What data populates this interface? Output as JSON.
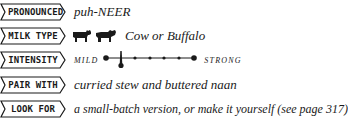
{
  "rows": [
    {
      "label": "PRONOUNCED",
      "value": "puh-NEER"
    },
    {
      "label": "MILK TYPE",
      "value": "Cow or Buffalo",
      "icons": [
        "cow-icon",
        "buffalo-icon"
      ]
    },
    {
      "label": "INTENSITY",
      "scale": {
        "min_label": "MILD",
        "max_label": "STRONG",
        "points": 7,
        "selected_position": 1.3
      }
    },
    {
      "label": "PAIR WITH",
      "value": "curried stew and buttered naan"
    },
    {
      "label": "LOOK FOR",
      "value": "a small-batch version, or make it yourself (see page 317)"
    }
  ],
  "colors": {
    "ink": "#1a1a1a",
    "background": "#ffffff"
  }
}
